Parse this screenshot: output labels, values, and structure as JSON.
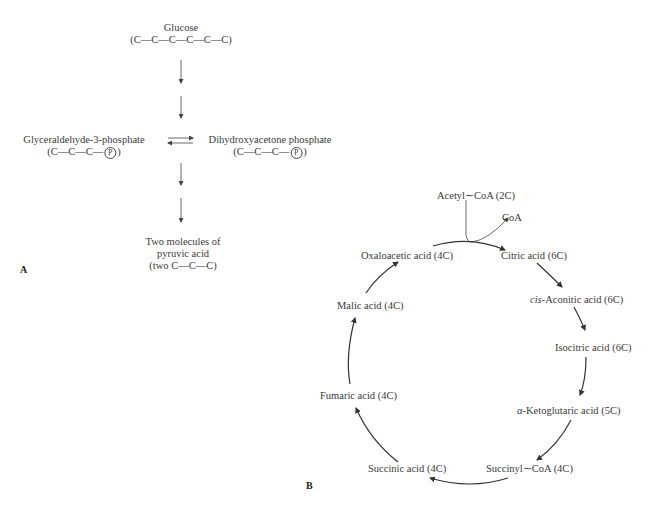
{
  "panel_a": {
    "label": "A",
    "glucose": {
      "name": "Glucose",
      "formula": "(C—C—C—C—C—C)"
    },
    "g3p": {
      "name": "Glyceraldehyde-3-phosphate",
      "formula_pre": "(C—C—C—",
      "phosphate": "P",
      "formula_post": ")"
    },
    "dhap": {
      "name": "Dihydroxyacetone phosphate",
      "formula_pre": "(C—C—C—",
      "phosphate": "P",
      "formula_post": ")"
    },
    "pyruvate": {
      "line1": "Two molecules of",
      "line2": "pyruvic acid",
      "line3": "(two C—C—C)"
    }
  },
  "panel_b": {
    "label": "B",
    "acetyl_coa": "Acetyl∼CoA (2C)",
    "coa": "CoA",
    "cycle": [
      {
        "id": "citric",
        "name": "Citric acid (6C)"
      },
      {
        "id": "aconitic",
        "prefix": "cis",
        "name": "-Aconitic acid (6C)"
      },
      {
        "id": "isocitric",
        "name": "Isocitric acid (6C)"
      },
      {
        "id": "ketoglutaric",
        "prefix": "α",
        "name": "-Ketoglutaric acid (5C)"
      },
      {
        "id": "succinyl",
        "name": "Succinyl∼CoA (4C)"
      },
      {
        "id": "succinic",
        "name": "Succinic acid (4C)"
      },
      {
        "id": "fumaric",
        "name": "Fumaric acid (4C)"
      },
      {
        "id": "malic",
        "name": "Malic acid (4C)"
      },
      {
        "id": "oxaloacetic",
        "name": "Oxaloacetic acid (4C)"
      }
    ]
  }
}
